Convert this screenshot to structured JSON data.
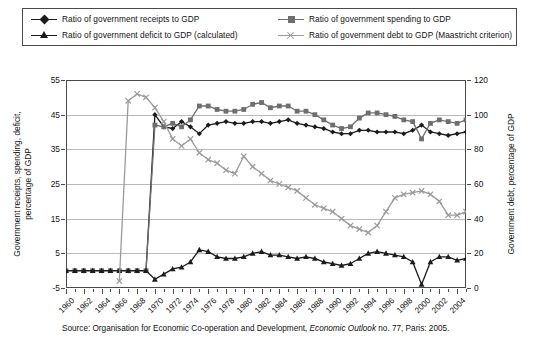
{
  "legend": {
    "items": [
      {
        "label": "Ratio of government receipts to GDP",
        "marker": "diamond-marker",
        "color": "#1b1b1b"
      },
      {
        "label": "Ratio of government spending to GDP",
        "marker": "square-marker",
        "color": "#6e6e6e"
      },
      {
        "label": "Ratio of government deficit to GDP (calculated)",
        "marker": "triangle-marker",
        "color": "#1b1b1b"
      },
      {
        "label": "Ratio of government debt to GDP (Maastricht criterion)",
        "marker": "x-marker",
        "color": "#9a9a9a"
      }
    ]
  },
  "axes": {
    "left_title": "Government receipts, spending, deficit,\npercentage of GDP",
    "left_title_line1": "Government receipts, spending, deficit,",
    "left_title_line2": "percentage of GDP",
    "right_title": "Government debt, percentage of GDP",
    "left_ticks": [
      "55",
      "45",
      "35",
      "25",
      "15",
      "5",
      "-5"
    ],
    "right_ticks": [
      "120",
      "100",
      "80",
      "60",
      "40",
      "20",
      "0"
    ]
  },
  "source": {
    "prefix": "Source: Organisation for Economic Co-operation and Development, ",
    "italic": "Economic Outlook",
    "suffix": " no. 77, Paris: 2005."
  },
  "chart_data": {
    "type": "line",
    "title": "",
    "xlabel": "",
    "ylabel": "Government receipts, spending, deficit, percentage of GDP",
    "y2label": "Government debt, percentage of GDP",
    "ylim": [
      -5,
      55
    ],
    "y2lim": [
      0,
      120
    ],
    "xlim": [
      1960,
      2005
    ],
    "grid": true,
    "legend_position": "top",
    "x": [
      1960,
      1961,
      1962,
      1963,
      1964,
      1965,
      1966,
      1967,
      1968,
      1969,
      1970,
      1971,
      1972,
      1973,
      1974,
      1975,
      1976,
      1977,
      1978,
      1979,
      1980,
      1981,
      1982,
      1983,
      1984,
      1985,
      1986,
      1987,
      1988,
      1989,
      1990,
      1991,
      1992,
      1993,
      1994,
      1995,
      1996,
      1997,
      1998,
      1999,
      2000,
      2001,
      2002,
      2003,
      2004,
      2005
    ],
    "xtick_labels": [
      "1960",
      "1962",
      "1964",
      "1966",
      "1968",
      "1970",
      "1972",
      "1974",
      "1976",
      "1978",
      "1980",
      "1982",
      "1984",
      "1986",
      "1988",
      "1990",
      "1992",
      "1994",
      "1996",
      "1998",
      "2000",
      "2002",
      "2004"
    ],
    "series": [
      {
        "name": "Ratio of government receipts to GDP",
        "axis": "left",
        "marker": "diamond",
        "color": "#1b1b1b",
        "values": [
          0,
          0,
          0,
          0,
          0,
          0,
          0,
          0,
          0,
          0,
          45,
          41.5,
          41.0,
          43.0,
          41.5,
          39.5,
          42.0,
          42.5,
          43.0,
          42.5,
          42.5,
          43.0,
          43.0,
          42.5,
          43.0,
          43.5,
          42.5,
          42.0,
          41.5,
          41.0,
          40.0,
          39.5,
          39.5,
          40.5,
          40.5,
          40.0,
          40.0,
          40.0,
          39.5,
          40.5,
          42.0,
          40.0,
          39.5,
          39.0,
          39.5,
          40.0
        ]
      },
      {
        "name": "Ratio of government spending to GDP",
        "axis": "left",
        "marker": "square",
        "color": "#6e6e6e",
        "values": [
          0,
          0,
          0,
          0,
          0,
          0,
          0,
          0,
          0,
          0,
          42.0,
          41.5,
          42.5,
          41.5,
          43.5,
          47.5,
          47.5,
          46.5,
          46.0,
          46.0,
          46.5,
          48.0,
          48.5,
          47.0,
          47.5,
          47.5,
          46.0,
          46.0,
          45.0,
          43.5,
          42.0,
          41.0,
          41.5,
          44.0,
          45.5,
          45.5,
          45.0,
          44.5,
          43.5,
          43.0,
          38.0,
          42.5,
          43.5,
          43.0,
          42.5,
          43.5
        ]
      },
      {
        "name": "Ratio of government deficit to GDP (calculated)",
        "axis": "left",
        "marker": "triangle",
        "color": "#1b1b1b",
        "values": [
          0,
          0,
          0,
          0,
          0,
          0,
          0,
          0,
          0,
          0,
          -2.5,
          -1.0,
          0.5,
          1.0,
          2.5,
          6.0,
          5.5,
          4.0,
          3.5,
          3.5,
          4.0,
          5.0,
          5.5,
          4.5,
          4.5,
          4.0,
          3.5,
          4.0,
          3.5,
          2.5,
          2.0,
          1.5,
          2.0,
          3.5,
          5.0,
          5.5,
          5.0,
          4.5,
          4.0,
          2.5,
          -4.0,
          2.5,
          4.0,
          4.0,
          3.0,
          3.5
        ]
      },
      {
        "name": "Ratio of government debt to GDP (Maastricht criterion)",
        "axis": "right",
        "marker": "x",
        "color": "#9a9a9a",
        "values": [
          null,
          null,
          null,
          null,
          null,
          null,
          4,
          108,
          112,
          110,
          104,
          96,
          86,
          82,
          86,
          78,
          74,
          72,
          68,
          66,
          76,
          70,
          66,
          62,
          60,
          58,
          56,
          52,
          48,
          46,
          44,
          40,
          36,
          34,
          32,
          36,
          44,
          52,
          54,
          55,
          56,
          54,
          50,
          42,
          42,
          44
        ]
      }
    ]
  }
}
